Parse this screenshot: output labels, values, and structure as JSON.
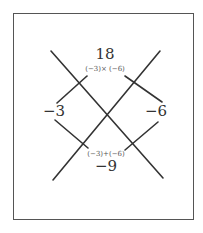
{
  "diagram": {
    "type": "x-factor-diagram",
    "top": {
      "value": "18",
      "expression": "(−3)× (−6)"
    },
    "left": {
      "value": "−3"
    },
    "right": {
      "value": "−6"
    },
    "bottom": {
      "value": "−9",
      "expression": "(−3)+(−6)"
    }
  },
  "colors": {
    "line": "#333333",
    "border": "#555555",
    "text": "#333333"
  }
}
